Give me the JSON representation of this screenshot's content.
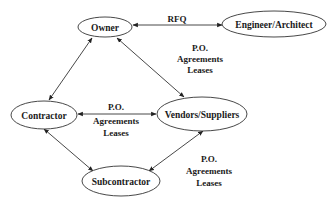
{
  "diagram": {
    "type": "relationship-diagram",
    "nodes": [
      {
        "id": "owner",
        "label": "Owner",
        "cx": 105,
        "cy": 27,
        "rx": 27,
        "ry": 10
      },
      {
        "id": "engineer",
        "label": "Engineer/Architect",
        "cx": 274,
        "cy": 24,
        "rx": 52,
        "ry": 13
      },
      {
        "id": "contractor",
        "label": "Contractor",
        "cx": 44,
        "cy": 115,
        "rx": 33,
        "ry": 14
      },
      {
        "id": "vendors",
        "label": "Vendors/Suppliers",
        "cx": 202,
        "cy": 114,
        "rx": 45,
        "ry": 17
      },
      {
        "id": "subcontractor",
        "label": "Subcontractor",
        "cx": 121,
        "cy": 181,
        "rx": 39,
        "ry": 15
      }
    ],
    "edges": [
      {
        "from": "owner",
        "to": "engineer",
        "direction": "both",
        "label": [
          "RFQ"
        ]
      },
      {
        "from": "owner",
        "to": "contractor",
        "direction": "both",
        "label": []
      },
      {
        "from": "vendors",
        "to": "owner",
        "direction": "both",
        "label": [
          "P.O.",
          "Agreements",
          "Leases"
        ]
      },
      {
        "from": "contractor",
        "to": "vendors",
        "direction": "both",
        "label": [
          "P.O.",
          "Agreements",
          "Leases"
        ]
      },
      {
        "from": "contractor",
        "to": "subcontractor",
        "direction": "both",
        "label": []
      },
      {
        "from": "subcontractor",
        "to": "vendors",
        "direction": "both",
        "label": [
          "P.O.",
          "Agreements",
          "Leases"
        ]
      }
    ]
  },
  "labels": {
    "owner": "Owner",
    "engineer": "Engineer/Architect",
    "contractor": "Contractor",
    "vendors": "Vendors/Suppliers",
    "subcontractor": "Subcontractor",
    "rfq": "RFQ",
    "owner_vendor": {
      "l1": "P.O.",
      "l2": "Agreements",
      "l3": "Leases"
    },
    "contractor_vendor": {
      "l1": "P.O.",
      "l2": "Agreements",
      "l3": "Leases"
    },
    "sub_vendor": {
      "l1": "P.O.",
      "l2": "Agreements",
      "l3": "Leases"
    }
  },
  "colors": {
    "stroke": "#333333",
    "text": "#1a1a1a",
    "background": "#ffffff"
  }
}
